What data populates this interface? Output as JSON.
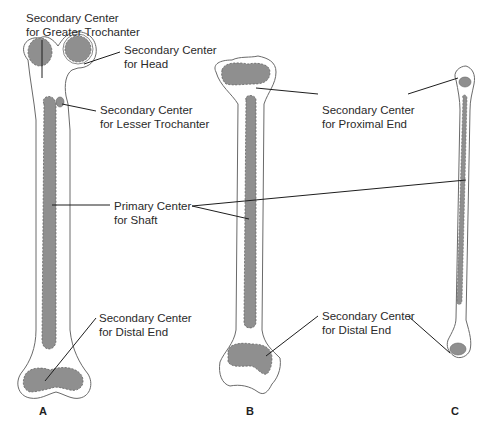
{
  "figure": {
    "colors": {
      "ossification_fill": "#8f8f8f",
      "bone_outline": "#6a6a6a",
      "leader_line": "#1e1e1e",
      "background": "#ffffff"
    },
    "panels": [
      {
        "id": "A",
        "label": "A"
      },
      {
        "id": "B",
        "label": "B"
      },
      {
        "id": "C",
        "label": "C"
      }
    ],
    "labels": {
      "greater_trochanter": {
        "line1": "Secondary Center",
        "line2": "for Greater Trochanter"
      },
      "head": {
        "line1": "Secondary Center",
        "line2": "for Head"
      },
      "lesser_trochanter": {
        "line1": "Secondary Center",
        "line2": "for Lesser Trochanter"
      },
      "primary_shaft": {
        "line1": "Primary Center",
        "line2": "for Shaft"
      },
      "distal_end_a": {
        "line1": "Secondary Center",
        "line2": "for Distal End"
      },
      "proximal_end": {
        "line1": "Secondary Center",
        "line2": "for Proximal End"
      },
      "distal_end_bc": {
        "line1": "Secondary Center",
        "line2": "for Distal End"
      }
    }
  }
}
